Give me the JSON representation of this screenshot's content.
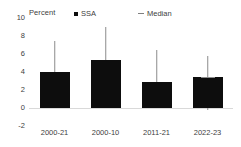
{
  "chart_data": {
    "type": "bar",
    "title": "",
    "xlabel": "",
    "ylabel": "Percent",
    "categories": [
      "2000-21",
      "2000-10",
      "2011-21",
      "2022-23"
    ],
    "values": [
      4.0,
      5.3,
      2.9,
      3.5
    ],
    "error_low": [
      2.2,
      3.1,
      1.4,
      -0.2
    ],
    "error_high": [
      7.4,
      9.0,
      6.4,
      5.8
    ],
    "median": [
      null,
      null,
      null,
      3.5
    ],
    "ylim": [
      -2,
      10
    ],
    "yticks": [
      10,
      8,
      6,
      4,
      2,
      0,
      -2
    ],
    "ytick_labels": [
      "10",
      "8",
      "6",
      "4",
      "2",
      "0",
      "-2"
    ],
    "grid": false,
    "zero_line": true,
    "legend_position": "top",
    "series": [
      {
        "name": "SSA",
        "marker": "square",
        "color": "#0d0d0d",
        "values": [
          4.0,
          5.3,
          2.9,
          3.5
        ]
      },
      {
        "name": "Median",
        "marker": "dash",
        "color": "#8c8c8c",
        "values": [
          null,
          null,
          null,
          3.5
        ]
      }
    ]
  },
  "axis": {
    "y_title": "Percent"
  },
  "legend": {
    "items": [
      {
        "label": "SSA",
        "marker": "square-marker"
      },
      {
        "label": "Median",
        "marker": "dash-marker"
      }
    ]
  },
  "colors": {
    "bar": "#0d0d0d",
    "whisker": "#8c8c8c",
    "zero_line": "#d9d9d9",
    "text": "#404040",
    "background": "#ffffff"
  }
}
